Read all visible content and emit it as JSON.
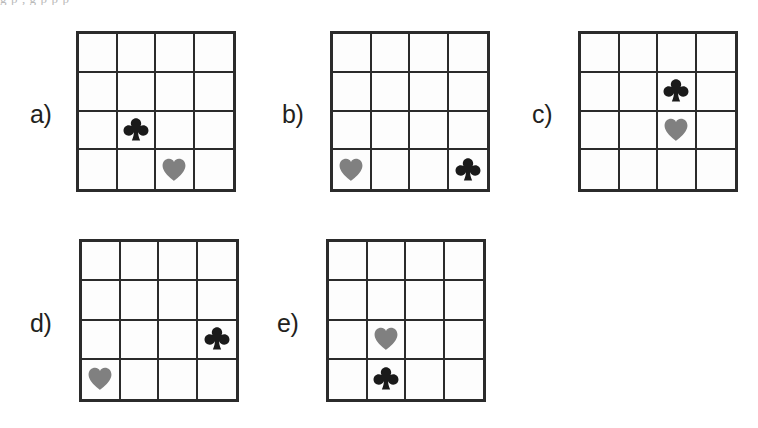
{
  "figure": {
    "cut_off_text_above": "g   p   ,  g  p   p    p",
    "grid_rows": 4,
    "grid_cols": 4,
    "colors": {
      "club": "#1a1a1a",
      "heart": "#808080",
      "grid_line": "#2b2b2b",
      "background": "#ffffff",
      "label_text": "#231f20"
    },
    "symbol_glyphs": {
      "club": "♣",
      "heart": "♥"
    },
    "items": [
      {
        "label": "a)",
        "label_x": 30,
        "label_y": 102,
        "grid_x": 76,
        "grid_y": 31,
        "grid_w": 160,
        "grid_h": 161,
        "symbols": [
          {
            "name": "club",
            "row": 3,
            "col": 2
          },
          {
            "name": "heart",
            "row": 4,
            "col": 3
          }
        ]
      },
      {
        "label": "b)",
        "label_x": 282,
        "label_y": 102,
        "grid_x": 330,
        "grid_y": 31,
        "grid_w": 160,
        "grid_h": 161,
        "symbols": [
          {
            "name": "heart",
            "row": 4,
            "col": 1
          },
          {
            "name": "club",
            "row": 4,
            "col": 4
          }
        ]
      },
      {
        "label": "c)",
        "label_x": 532,
        "label_y": 102,
        "grid_x": 578,
        "grid_y": 31,
        "grid_w": 160,
        "grid_h": 161,
        "symbols": [
          {
            "name": "club",
            "row": 2,
            "col": 3
          },
          {
            "name": "heart",
            "row": 3,
            "col": 3
          }
        ]
      },
      {
        "label": "d)",
        "label_x": 30,
        "label_y": 311,
        "grid_x": 79,
        "grid_y": 239,
        "grid_w": 160,
        "grid_h": 163,
        "symbols": [
          {
            "name": "club",
            "row": 3,
            "col": 4
          },
          {
            "name": "heart",
            "row": 4,
            "col": 1
          }
        ]
      },
      {
        "label": "e)",
        "label_x": 277,
        "label_y": 311,
        "grid_x": 326,
        "grid_y": 239,
        "grid_w": 160,
        "grid_h": 163,
        "symbols": [
          {
            "name": "heart",
            "row": 3,
            "col": 2
          },
          {
            "name": "club",
            "row": 4,
            "col": 2
          }
        ]
      }
    ]
  }
}
